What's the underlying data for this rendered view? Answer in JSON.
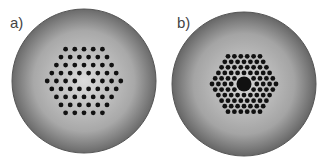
{
  "panels": [
    {
      "label": "a)",
      "description": "Photonic crystal fiber cross-section, solid core (one missing hole), hexagonal air-hole lattice",
      "rows": [
        5,
        6,
        7,
        8,
        9,
        8,
        7,
        6,
        5
      ],
      "core": "solid"
    },
    {
      "label": "b)",
      "description": "Hollow-core photonic bandgap fiber cross-section, large central air core",
      "rows": [
        6,
        7,
        8,
        9,
        10,
        11,
        10,
        9,
        8,
        7,
        6
      ],
      "core": "hollow"
    }
  ],
  "colors": {
    "cladding_center": "#d8d8d8",
    "cladding_edge": "#6a6a6a",
    "hole": "#111111",
    "label": "#444444"
  }
}
